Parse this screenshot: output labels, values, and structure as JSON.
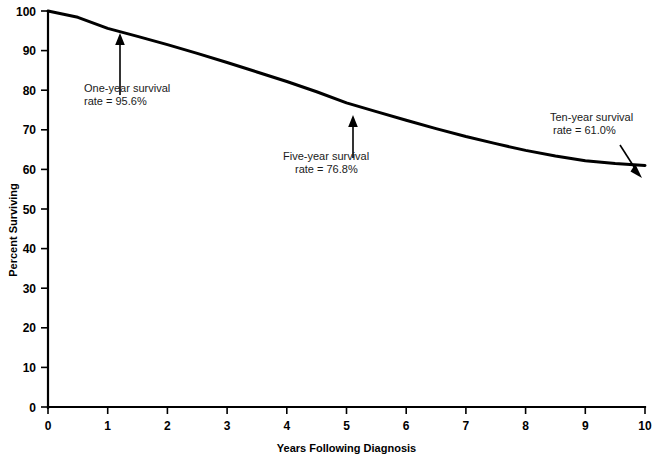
{
  "chart_data": {
    "type": "line",
    "title": "",
    "xlabel": "Years Following Diagnosis",
    "ylabel": "Percent Surviving",
    "xlim": [
      0,
      10
    ],
    "ylim": [
      0,
      100
    ],
    "grid": false,
    "legend": "none",
    "x_ticks": [
      "0",
      "1",
      "2",
      "3",
      "4",
      "5",
      "6",
      "7",
      "8",
      "9",
      "10"
    ],
    "y_ticks": [
      "0",
      "10",
      "20",
      "30",
      "40",
      "50",
      "60",
      "70",
      "80",
      "90",
      "100"
    ],
    "series": [
      {
        "name": "Percent Surviving",
        "x": [
          0,
          0.5,
          1,
          1.5,
          2,
          2.5,
          3,
          3.5,
          4,
          4.5,
          5,
          5.5,
          6,
          6.5,
          7,
          7.5,
          8,
          8.5,
          9,
          9.5,
          10
        ],
        "values": [
          100.0,
          98.4,
          95.6,
          93.6,
          91.5,
          89.3,
          87.0,
          84.6,
          82.2,
          79.6,
          76.8,
          74.6,
          72.4,
          70.3,
          68.3,
          66.5,
          64.8,
          63.4,
          62.2,
          61.5,
          61.0
        ]
      }
    ],
    "annotations": [
      {
        "id": "one-year",
        "line1": "One-year survival",
        "line2": "rate = 95.6%",
        "value": 95.6,
        "at_year": 1,
        "arrow": "up"
      },
      {
        "id": "five-year",
        "line1": "Five-year survival",
        "line2": "rate = 76.8%",
        "value": 76.8,
        "at_year": 5,
        "arrow": "up"
      },
      {
        "id": "ten-year",
        "line1": "Ten-year survival",
        "line2": "rate = 61.0%",
        "value": 61.0,
        "at_year": 10,
        "arrow": "down-right"
      }
    ],
    "colors": {
      "line": "#000000",
      "axis": "#000000",
      "text": "#000000",
      "background": "#ffffff"
    }
  }
}
